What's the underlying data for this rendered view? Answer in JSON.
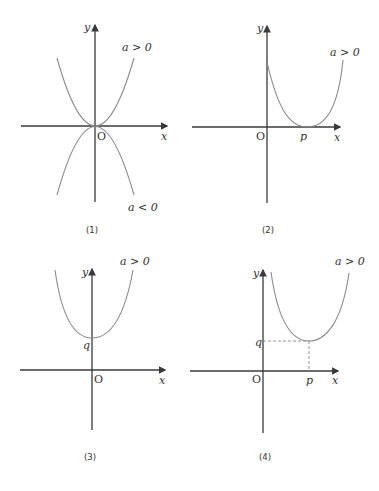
{
  "panels": [
    {
      "caption": "(1)",
      "axis_labels": {
        "x": "x",
        "y": "y",
        "origin": "O"
      },
      "curves": [
        {
          "label": "a > 0",
          "vertex": "O",
          "opens": "up"
        },
        {
          "label": "a < 0",
          "vertex": "O",
          "opens": "down"
        }
      ]
    },
    {
      "caption": "(2)",
      "axis_labels": {
        "x": "x",
        "y": "y",
        "origin": "O"
      },
      "point_labels": {
        "p": "p"
      },
      "curves": [
        {
          "label": "a > 0",
          "vertex": "(p, 0)",
          "opens": "up"
        }
      ]
    },
    {
      "caption": "(3)",
      "axis_labels": {
        "x": "x",
        "y": "y",
        "origin": "O"
      },
      "point_labels": {
        "q": "q"
      },
      "curves": [
        {
          "label": "a > 0",
          "vertex": "(0, q)",
          "opens": "up"
        }
      ]
    },
    {
      "caption": "(4)",
      "axis_labels": {
        "x": "x",
        "y": "y",
        "origin": "O"
      },
      "point_labels": {
        "p": "p",
        "q": "q"
      },
      "curves": [
        {
          "label": "a > 0",
          "vertex": "(p, q)",
          "opens": "up"
        }
      ]
    }
  ],
  "colors": {
    "axis": "#3a3a3a",
    "curve": "#8a8a8a",
    "text": "#333333"
  }
}
